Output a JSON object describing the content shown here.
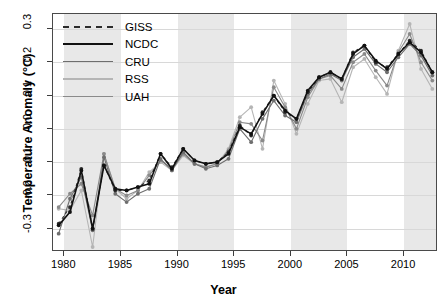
{
  "chart_data": {
    "type": "line",
    "title": "",
    "xlabel": "Year",
    "ylabel": "Temperature Anomaly (°C)",
    "xlim": [
      1979,
      2013
    ],
    "ylim": [
      -0.37,
      0.345
    ],
    "xticks": [
      1980,
      1985,
      1990,
      1995,
      2000,
      2005,
      2010
    ],
    "yticks": [
      -0.3,
      -0.2,
      -0.1,
      0.0,
      0.1,
      0.2,
      0.3
    ],
    "ytick_labels": [
      "-0.3",
      "-0.2",
      "-0.1",
      "0.0",
      "0.1",
      "0.2",
      "0.3"
    ],
    "xtick_labels": [
      "1980",
      "1985",
      "1990",
      "1995",
      "2000",
      "2005",
      "2010"
    ],
    "grid": "horizontal-gridlines-and-alternating-vertical-bands",
    "legend_position": "top-left-inside",
    "x": [
      1979.5,
      1980.5,
      1981.5,
      1982.5,
      1983.5,
      1984.5,
      1985.5,
      1986.5,
      1987.5,
      1988.5,
      1989.5,
      1990.5,
      1991.5,
      1992.5,
      1993.5,
      1994.5,
      1995.5,
      1996.5,
      1997.5,
      1998.5,
      1999.5,
      2000.5,
      2001.5,
      2002.5,
      2003.5,
      2004.5,
      2005.5,
      2006.5,
      2007.5,
      2008.5,
      2009.5,
      2010.5,
      2011.5,
      2012.5
    ],
    "series": [
      {
        "name": "GISS",
        "color": "#2b2b2b",
        "dash": "3,3",
        "values": [
          -0.285,
          -0.235,
          -0.12,
          -0.3,
          -0.11,
          -0.185,
          -0.185,
          -0.175,
          -0.155,
          -0.075,
          -0.115,
          -0.06,
          -0.095,
          -0.105,
          -0.1,
          -0.07,
          0.01,
          -0.02,
          0.05,
          0.1,
          0.05,
          0.03,
          0.11,
          0.155,
          0.17,
          0.15,
          0.23,
          0.25,
          0.2,
          0.185,
          0.225,
          0.265,
          0.235,
          0.17
        ]
      },
      {
        "name": "NCDC",
        "color": "#111111",
        "dash": "",
        "values": [
          -0.29,
          -0.25,
          -0.125,
          -0.3,
          -0.11,
          -0.18,
          -0.185,
          -0.175,
          -0.165,
          -0.075,
          -0.12,
          -0.06,
          -0.095,
          -0.105,
          -0.1,
          -0.075,
          0.005,
          -0.015,
          0.045,
          0.1,
          0.055,
          0.03,
          0.115,
          0.155,
          0.17,
          0.15,
          0.225,
          0.25,
          0.205,
          0.18,
          0.225,
          0.26,
          0.23,
          0.17
        ]
      },
      {
        "name": "CRU",
        "color": "#6e6e6e",
        "dash": "",
        "values": [
          -0.315,
          -0.21,
          -0.145,
          -0.305,
          -0.085,
          -0.195,
          -0.22,
          -0.195,
          -0.18,
          -0.09,
          -0.125,
          -0.07,
          -0.105,
          -0.12,
          -0.11,
          -0.09,
          0.0,
          -0.04,
          0.03,
          0.085,
          0.04,
          0.02,
          0.105,
          0.15,
          0.165,
          0.145,
          0.215,
          0.24,
          0.195,
          0.17,
          0.215,
          0.255,
          0.22,
          0.16
        ]
      },
      {
        "name": "RSS",
        "color": "#b5b5b5",
        "dash": "",
        "values": [
          -0.24,
          -0.245,
          -0.185,
          -0.355,
          -0.075,
          -0.18,
          -0.21,
          -0.185,
          -0.13,
          -0.1,
          -0.125,
          -0.08,
          -0.105,
          -0.115,
          -0.105,
          -0.06,
          0.035,
          0.065,
          -0.06,
          0.145,
          0.075,
          -0.015,
          0.075,
          0.145,
          0.15,
          0.08,
          0.185,
          0.21,
          0.155,
          0.105,
          0.235,
          0.315,
          0.18,
          0.12
        ]
      },
      {
        "name": "UAH",
        "color": "#8a8a8a",
        "dash": "",
        "values": [
          -0.235,
          -0.195,
          -0.165,
          -0.26,
          -0.075,
          -0.18,
          -0.2,
          -0.185,
          -0.14,
          -0.095,
          -0.12,
          -0.075,
          -0.105,
          -0.115,
          -0.105,
          -0.065,
          0.02,
          0.015,
          -0.035,
          0.125,
          0.065,
          0.0,
          0.095,
          0.15,
          0.16,
          0.12,
          0.2,
          0.225,
          0.175,
          0.13,
          0.23,
          0.285,
          0.2,
          0.145
        ]
      }
    ],
    "bands": [
      {
        "from": 1980,
        "to": 1985
      },
      {
        "from": 1990,
        "to": 1995
      },
      {
        "from": 2000,
        "to": 2005
      },
      {
        "from": 2010,
        "to": 2013
      }
    ],
    "band_color": "#e8e8e8",
    "panel_border_color": "#4a4a4a",
    "gridline_color": "#d8d8d8",
    "point_marker": "filled-circle"
  },
  "legend": {
    "entries": [
      {
        "label": "GISS"
      },
      {
        "label": "NCDC"
      },
      {
        "label": "CRU"
      },
      {
        "label": "RSS"
      },
      {
        "label": "UAH"
      }
    ]
  }
}
